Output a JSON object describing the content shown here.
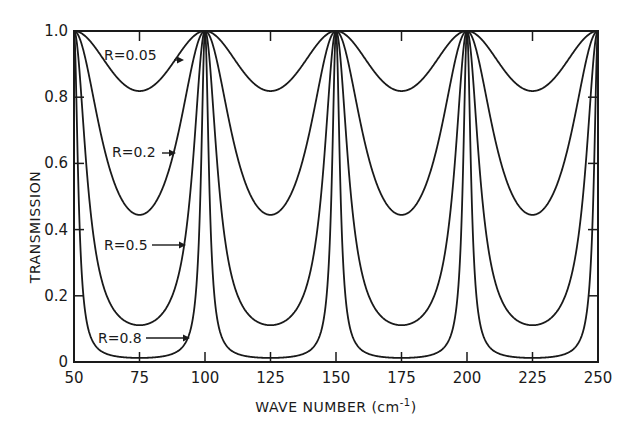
{
  "chart_data": {
    "type": "line",
    "title": "",
    "xlabel": "WAVE NUMBER (cm⁻¹)",
    "xlabel_main": "WAVE NUMBER (cm",
    "xlabel_sup": "-1",
    "xlabel_close": ")",
    "ylabel": "TRANSMISSION",
    "xlim": [
      50,
      250
    ],
    "ylim": [
      0,
      1.0
    ],
    "xticks": [
      50,
      75,
      100,
      125,
      150,
      175,
      200,
      225,
      250
    ],
    "xtick_labels": [
      "50",
      "75",
      "100",
      "125",
      "150",
      "175",
      "200",
      "225",
      "250"
    ],
    "yticks": [
      0,
      0.2,
      0.4,
      0.6,
      0.8,
      1.0
    ],
    "ytick_labels": [
      "0",
      "0.2",
      "0.4",
      "0.6",
      "0.8",
      "1.0"
    ],
    "grid": false,
    "legend": "inline labels with arrows",
    "free_spectral_range": 50,
    "peak_positions": [
      50,
      100,
      150,
      200,
      250
    ],
    "series": [
      {
        "name": "R=0.05",
        "reflectivity": 0.05,
        "min_transmission": 0.82,
        "peak_transmission": 1.0,
        "label": "R=0.05",
        "label_pos": [
          104,
          60
        ],
        "arrow": [
          174,
          60,
          180,
          60
        ]
      },
      {
        "name": "R=0.2",
        "reflectivity": 0.2,
        "min_transmission": 0.44,
        "peak_transmission": 1.0,
        "label": "R=0.2",
        "label_pos": [
          112,
          157
        ],
        "arrow": [
          162,
          153,
          172,
          153
        ]
      },
      {
        "name": "R=0.5",
        "reflectivity": 0.5,
        "min_transmission": 0.11,
        "peak_transmission": 1.0,
        "label": "R=0.5",
        "label_pos": [
          104,
          250
        ],
        "arrow": [
          152,
          245,
          182,
          245
        ]
      },
      {
        "name": "R=0.8",
        "reflectivity": 0.8,
        "min_transmission": 0.01,
        "peak_transmission": 1.0,
        "label": "R=0.8",
        "label_pos": [
          98,
          343
        ],
        "arrow": [
          146,
          338,
          186,
          338
        ]
      }
    ]
  },
  "colors": {
    "line": "#1a1a1a",
    "background": "#ffffff"
  }
}
